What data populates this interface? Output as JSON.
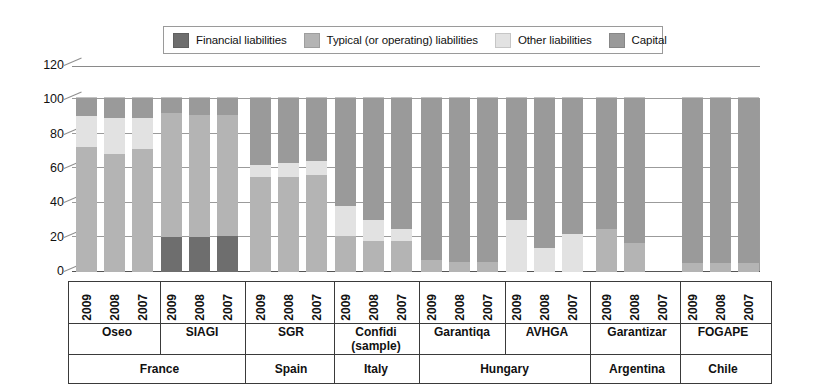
{
  "legend": {
    "items": [
      {
        "label": "Financial liabilities",
        "color": "#6e6e6e",
        "key": "financial"
      },
      {
        "label": "Typical (or operating) liabilities",
        "color": "#b4b4b4",
        "key": "typical"
      },
      {
        "label": "Other liabilities",
        "color": "#e2e2e2",
        "key": "other"
      },
      {
        "label": "Capital",
        "color": "#9a9a9a",
        "key": "capital"
      }
    ]
  },
  "axis": {
    "yticks": [
      "120",
      "100",
      "80",
      "60",
      "40",
      "20",
      "0"
    ],
    "ymin": 0,
    "ymax": 120
  },
  "countries": [
    {
      "name": "France",
      "institutions": [
        "Oseo",
        "SIAGI"
      ]
    },
    {
      "name": "Spain",
      "institutions": [
        "SGR"
      ]
    },
    {
      "name": "Italy",
      "institutions": [
        "Confidi\n(sample)"
      ]
    },
    {
      "name": "Hungary",
      "institutions": [
        "Garantiqa",
        "AVHGA"
      ]
    },
    {
      "name": "Argentina",
      "institutions": [
        "Garantizar"
      ]
    },
    {
      "name": "Chile",
      "institutions": [
        "FOGAPE"
      ]
    }
  ],
  "years": [
    "2009",
    "2008",
    "2007"
  ],
  "chart_data": {
    "type": "bar",
    "subtype": "stacked-column",
    "title": "",
    "xlabel": "",
    "ylabel": "",
    "ylim": [
      0,
      120
    ],
    "yticks": [
      0,
      20,
      40,
      60,
      80,
      100,
      120
    ],
    "grid": true,
    "legend_position": "top",
    "stack_order": [
      "financial",
      "typical",
      "other",
      "capital"
    ],
    "series": [
      {
        "name": "Financial liabilities",
        "key": "financial",
        "color": "#6e6e6e"
      },
      {
        "name": "Typical (or operating) liabilities",
        "key": "typical",
        "color": "#b4b4b4"
      },
      {
        "name": "Other liabilities",
        "key": "other",
        "color": "#e2e2e2"
      },
      {
        "name": "Capital",
        "key": "capital",
        "color": "#9a9a9a"
      }
    ],
    "categories": [
      "Oseo 2009",
      "Oseo 2008",
      "Oseo 2007",
      "SIAGI 2009",
      "SIAGI 2008",
      "SIAGI 2007",
      "SGR 2009",
      "SGR 2008",
      "SGR 2007",
      "Confidi (sample) 2009",
      "Confidi (sample) 2008",
      "Confidi (sample) 2007",
      "Garantiqa 2009",
      "Garantiqa 2008",
      "Garantiqa 2007",
      "AVHGA 2009",
      "AVHGA 2008",
      "AVHGA 2007",
      "Garantizar 2009",
      "Garantizar 2008",
      "Garantizar 2007",
      "FOGAPE 2009",
      "FOGAPE 2008",
      "FOGAPE 2007"
    ],
    "bars": [
      {
        "country": "France",
        "institution": "Oseo",
        "year": "2009",
        "financial": 0,
        "typical": 72,
        "other": 18,
        "capital": 11
      },
      {
        "country": "France",
        "institution": "Oseo",
        "year": "2008",
        "financial": 0,
        "typical": 68,
        "other": 21,
        "capital": 12
      },
      {
        "country": "France",
        "institution": "Oseo",
        "year": "2007",
        "financial": 0,
        "typical": 71,
        "other": 18,
        "capital": 12
      },
      {
        "country": "France",
        "institution": "SIAGI",
        "year": "2009",
        "financial": 20,
        "typical": 72,
        "other": 0,
        "capital": 9
      },
      {
        "country": "France",
        "institution": "SIAGI",
        "year": "2008",
        "financial": 20,
        "typical": 71,
        "other": 0,
        "capital": 10
      },
      {
        "country": "France",
        "institution": "SIAGI",
        "year": "2007",
        "financial": 21,
        "typical": 70,
        "other": 0,
        "capital": 10
      },
      {
        "country": "Spain",
        "institution": "SGR",
        "year": "2009",
        "financial": 0,
        "typical": 55,
        "other": 7,
        "capital": 39
      },
      {
        "country": "Spain",
        "institution": "SGR",
        "year": "2008",
        "financial": 0,
        "typical": 55,
        "other": 8,
        "capital": 38
      },
      {
        "country": "Spain",
        "institution": "SGR",
        "year": "2007",
        "financial": 0,
        "typical": 56,
        "other": 8,
        "capital": 37
      },
      {
        "country": "Italy",
        "institution": "Confidi (sample)",
        "year": "2009",
        "financial": 0,
        "typical": 21,
        "other": 17,
        "capital": 63
      },
      {
        "country": "Italy",
        "institution": "Confidi (sample)",
        "year": "2008",
        "financial": 0,
        "typical": 18,
        "other": 12,
        "capital": 71
      },
      {
        "country": "Italy",
        "institution": "Confidi (sample)",
        "year": "2007",
        "financial": 0,
        "typical": 18,
        "other": 7,
        "capital": 76
      },
      {
        "country": "Hungary",
        "institution": "Garantiqa",
        "year": "2009",
        "financial": 0,
        "typical": 7,
        "other": 0,
        "capital": 94
      },
      {
        "country": "Hungary",
        "institution": "Garantiqa",
        "year": "2008",
        "financial": 0,
        "typical": 6,
        "other": 0,
        "capital": 95
      },
      {
        "country": "Hungary",
        "institution": "Garantiqa",
        "year": "2007",
        "financial": 0,
        "typical": 6,
        "other": 0,
        "capital": 95
      },
      {
        "country": "Hungary",
        "institution": "AVHGA",
        "year": "2009",
        "financial": 0,
        "typical": 0,
        "other": 30,
        "capital": 71
      },
      {
        "country": "Hungary",
        "institution": "AVHGA",
        "year": "2008",
        "financial": 0,
        "typical": 0,
        "other": 14,
        "capital": 87
      },
      {
        "country": "Hungary",
        "institution": "AVHGA",
        "year": "2007",
        "financial": 0,
        "typical": 0,
        "other": 22,
        "capital": 79
      },
      {
        "country": "Argentina",
        "institution": "Garantizar",
        "year": "2009",
        "financial": 0,
        "typical": 25,
        "other": 0,
        "capital": 76
      },
      {
        "country": "Argentina",
        "institution": "Garantizar",
        "year": "2008",
        "financial": 0,
        "typical": 17,
        "other": 0,
        "capital": 84
      },
      {
        "country": "Argentina",
        "institution": "Garantizar",
        "year": "2007",
        "financial": 0,
        "typical": 0,
        "other": 0,
        "capital": 0
      },
      {
        "country": "Chile",
        "institution": "FOGAPE",
        "year": "2009",
        "financial": 0,
        "typical": 5,
        "other": 0,
        "capital": 96
      },
      {
        "country": "Chile",
        "institution": "FOGAPE",
        "year": "2008",
        "financial": 0,
        "typical": 5,
        "other": 0,
        "capital": 96
      },
      {
        "country": "Chile",
        "institution": "FOGAPE",
        "year": "2007",
        "financial": 0,
        "typical": 5,
        "other": 0,
        "capital": 96
      }
    ]
  }
}
